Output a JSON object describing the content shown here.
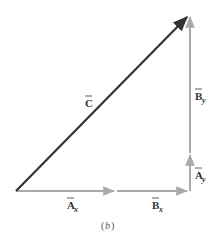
{
  "diagram": {
    "caption": {
      "open": "(",
      "letter": "b",
      "close": ")"
    },
    "colors": {
      "resultant": "#333333",
      "component": "#aaaaaa",
      "background": "#ffffff"
    },
    "vectors": [
      {
        "id": "C",
        "label": "C",
        "subscript": "",
        "from": [
          16,
          191
        ],
        "to": [
          189,
          15
        ]
      },
      {
        "id": "Ax",
        "label": "A",
        "subscript": "x",
        "from": [
          16,
          191
        ],
        "to": [
          116,
          191
        ]
      },
      {
        "id": "Bx",
        "label": "B",
        "subscript": "x",
        "from": [
          116,
          191
        ],
        "to": [
          189,
          191
        ]
      },
      {
        "id": "Ay",
        "label": "A",
        "subscript": "y",
        "from": [
          189,
          191
        ],
        "to": [
          189,
          153
        ]
      },
      {
        "id": "By",
        "label": "B",
        "subscript": "y",
        "from": [
          189,
          153
        ],
        "to": [
          189,
          15
        ]
      }
    ],
    "labels": {
      "C": {
        "main": "C",
        "sub": ""
      },
      "Ax": {
        "main": "A",
        "sub": "x"
      },
      "Bx": {
        "main": "B",
        "sub": "x"
      },
      "Ay": {
        "main": "A",
        "sub": "y"
      },
      "By": {
        "main": "B",
        "sub": "y"
      }
    }
  }
}
